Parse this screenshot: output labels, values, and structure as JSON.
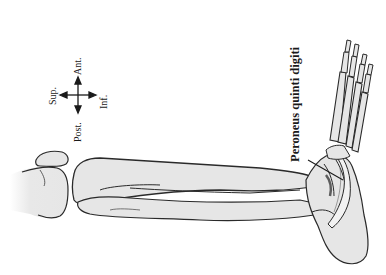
{
  "figure": {
    "type": "anatomical line drawing",
    "colors": {
      "background": "#ffffff",
      "bone_fill": "#e6e6e6",
      "outline": "#2a2a2a",
      "text": "#1a1a1a"
    }
  },
  "compass": {
    "up": "Ant.",
    "left": "Sup.",
    "right": "Inf.",
    "down": "Post."
  },
  "annotations": [
    {
      "label": "Peroneus quinti digiti",
      "style": "bold",
      "orientation": "vertical, reading bottom-to-top",
      "leader_line": true
    }
  ]
}
